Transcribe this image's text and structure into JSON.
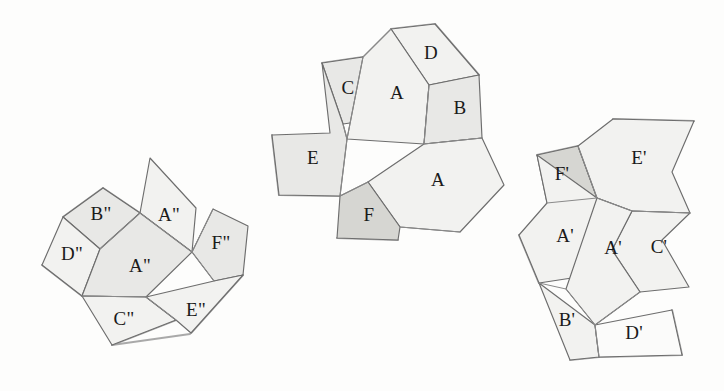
{
  "figure": {
    "background_color": "#fdfdfc",
    "stroke_color": "#6d6d6d",
    "label_color": "#1a1a1a",
    "fill_light": "#f2f2f0",
    "fill_mid": "#e8e8e6",
    "fill_dark": "#d6d6d2",
    "fill_white": "#fbfbfa"
  },
  "nets": [
    {
      "id": "net-left",
      "name": "left-net",
      "faces": [
        {
          "label": "B\"",
          "shade": "mid",
          "points": "63,217 103,188 140,213 100,249",
          "lx": 101,
          "ly": 216
        },
        {
          "label": "D\"",
          "shade": "light",
          "points": "63,217 100,249 82,296 42,265",
          "lx": 72,
          "ly": 256
        },
        {
          "label": "A\"",
          "shade": "light",
          "points": "140,213 150,158 196,208 192,252",
          "lx": 169,
          "ly": 217
        },
        {
          "label": "A\"",
          "shade": "mid",
          "points": "100,249 140,213 192,252 146,297 82,296",
          "lx": 140,
          "ly": 268
        },
        {
          "label": "F\"",
          "shade": "mid",
          "points": "192,252 213,209 248,226 243,275 214,281",
          "lx": 221,
          "ly": 245
        },
        {
          "label": "C\"",
          "shade": "light",
          "points": "82,296 146,297 176,320 112,345",
          "lx": 124,
          "ly": 321
        },
        {
          "label": "E\"",
          "shade": "light",
          "points": "146,297 214,281 243,275 191,333 176,320",
          "lx": 196,
          "ly": 312
        }
      ],
      "fold_edges": [
        "100,249 140,213",
        "140,213 192,252",
        "82,296 146,297",
        "146,297 176,320",
        "192,252 214,281",
        "213,209 192,252"
      ],
      "shadow_edges": [
        "63,217 103,188",
        "103,188 140,213",
        "42,265 82,296",
        "112,345 176,320",
        "112,345 190,334",
        "191,333 243,275"
      ]
    },
    {
      "id": "net-middle",
      "name": "middle-net",
      "faces": [
        {
          "label": "D",
          "shade": "light",
          "points": "391,29 435,24 479,75 429,85",
          "lx": 431,
          "ly": 55
        },
        {
          "label": "C",
          "shade": "mid",
          "points": "322,63 363,57 371,120 343,124",
          "lx": 348,
          "ly": 90
        },
        {
          "label": "A",
          "shade": "light",
          "points": "391,29 429,85 424,144 347,139 363,57",
          "lx": 397,
          "ly": 95
        },
        {
          "label": "B",
          "shade": "mid",
          "points": "429,85 479,75 482,138 424,144",
          "lx": 460,
          "ly": 110
        },
        {
          "label": "E",
          "shade": "mid",
          "points": "322,63 343,124 347,139 340,196 279,195 272,135 330,133",
          "lx": 313,
          "ly": 160
        },
        {
          "label": "A",
          "shade": "light",
          "points": "424,144 482,138 504,185 460,232 400,227 368,182",
          "lx": 438,
          "ly": 182
        },
        {
          "label": "F",
          "shade": "dark",
          "points": "340,196 368,182 400,227 398,240 337,238",
          "lx": 369,
          "ly": 217
        }
      ],
      "fold_edges": [
        "363,57 391,29",
        "429,85 424,144",
        "347,139 363,57",
        "424,144 482,138",
        "343,124 347,139",
        "340,196 368,182",
        "347,139 340,196",
        "400,227 460,232"
      ],
      "shadow_edges": [
        "391,29 435,24",
        "435,24 479,75",
        "322,63 363,57",
        "272,135 279,195",
        "279,195 340,196",
        "337,238 398,240"
      ]
    },
    {
      "id": "net-right",
      "name": "right-net",
      "faces": [
        {
          "label": "F'",
          "shade": "dark",
          "points": "537,155 578,146 597,198 547,203",
          "lx": 562,
          "ly": 176
        },
        {
          "label": "E'",
          "shade": "light",
          "points": "578,146 613,119 694,121 672,172 690,213 632,211 597,198",
          "lx": 639,
          "ly": 160
        },
        {
          "label": "A'",
          "shade": "light",
          "points": "537,155 547,203 519,235 539,283 598,274 597,198",
          "lx": 565,
          "ly": 238
        },
        {
          "label": "C'",
          "shade": "light",
          "points": "632,211 690,213 662,240 689,287 640,292 612,250",
          "lx": 659,
          "ly": 249
        },
        {
          "label": "A'",
          "shade": "light",
          "points": "597,198 632,211 612,250 640,292 595,325 566,289",
          "lx": 613,
          "ly": 250
        },
        {
          "label": "B'",
          "shade": "light",
          "points": "539,283 595,325 599,357 570,360",
          "lx": 567,
          "ly": 322
        },
        {
          "label": "D'",
          "shade": "white",
          "points": "595,325 672,310 682,355 599,357",
          "lx": 634,
          "ly": 335
        }
      ],
      "fold_edges": [
        "578,146 597,198",
        "597,198 547,203",
        "597,198 632,211",
        "632,211 690,213",
        "539,283 566,289",
        "566,289 595,325",
        "595,325 599,357",
        "640,292 595,325"
      ],
      "shadow_edges": [
        "613,119 694,121",
        "537,155 578,146",
        "519,235 539,283",
        "570,360 599,357",
        "599,357 682,355",
        "672,310 682,355"
      ]
    }
  ]
}
